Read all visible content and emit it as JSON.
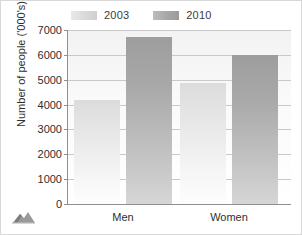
{
  "chart_data": {
    "type": "bar",
    "title": "",
    "xlabel": "",
    "ylabel": "Number of people ('000's)",
    "categories": [
      "Men",
      "Women"
    ],
    "series": [
      {
        "name": "2003",
        "values": [
          4200,
          4850
        ],
        "color": "#dcdcdc"
      },
      {
        "name": "2010",
        "values": [
          6700,
          6000
        ],
        "color": "#a0a0a0"
      }
    ],
    "ylim": [
      0,
      7000
    ],
    "yticks": [
      0,
      1000,
      2000,
      3000,
      4000,
      5000,
      6000,
      7000
    ],
    "ytick_labels": [
      "0",
      "1000",
      "2000",
      "3000",
      "4000",
      "5000",
      "6000",
      "7000"
    ],
    "grid": true,
    "legend_position": "top"
  },
  "legend": {
    "entries": [
      {
        "label": "2003",
        "swatch": "legend-swatch-2003"
      },
      {
        "label": "2010",
        "swatch": "legend-swatch-2010"
      }
    ]
  },
  "axes": {
    "y_title": "Number of people ('000's)",
    "y_ticks": [
      "7000",
      "6000",
      "5000",
      "4000",
      "3000",
      "2000",
      "1000",
      "0"
    ],
    "x_categories": [
      "Men",
      "Women"
    ]
  },
  "icons": {
    "corner": "mountain-icon"
  },
  "colors": {
    "series_2003": "#dcdcdc",
    "series_2010": "#a0a0a0",
    "axis": "#8f8f8f",
    "gridline": "#c9c9c9",
    "text": "#2f2f2f",
    "frame": "#d8d8d8"
  }
}
